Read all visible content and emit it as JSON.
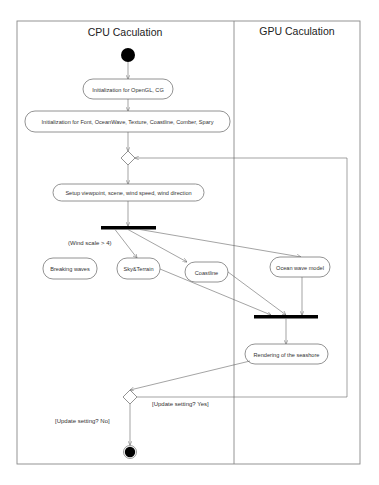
{
  "swimlanes": [
    {
      "label": "CPU Caculation"
    },
    {
      "label": "GPU Caculation"
    }
  ],
  "nodes": {
    "init_opengl": "Initialization for OpenGL, CG",
    "init_font": "Initialization for Font, OceanWave, Texture, Coastline, Comber, Spary",
    "setup": "Setup viewpoint, scene, wind speed, wind direction",
    "breaking_waves": "Breaking waves",
    "sky_terrain": "Sky&Terrain",
    "coastline": "Coastline",
    "ocean_wave_model": "Ocean wave model",
    "rendering": "Rendering of the seashore"
  },
  "guards": {
    "wind_scale": "(Wind scale > 4)",
    "update_yes": "[Update setting? Yes]",
    "update_no": "[Update setting? No]"
  },
  "colors": {
    "line": "#666666",
    "node_fill": "#000000",
    "frame": "#888888"
  }
}
